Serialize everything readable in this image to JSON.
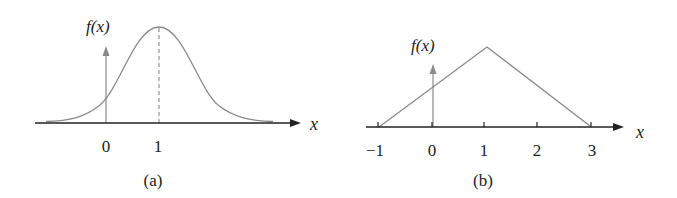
{
  "panels": [
    {
      "id": "a",
      "caption": "(a)",
      "ylabel": "f(x)",
      "xlabel": "x",
      "shape": "bell curve (normal density) centered at x = 1",
      "tick_labels": [
        "0",
        "1"
      ],
      "peak_x": 1,
      "dashed_line_at": 1
    },
    {
      "id": "b",
      "caption": "(b)",
      "ylabel": "f(x)",
      "xlabel": "x",
      "shape": "triangular density from -1 to 3 with peak at x = 1",
      "tick_labels": [
        "−1",
        "0",
        "1",
        "2",
        "3"
      ],
      "support": [
        -1,
        3
      ],
      "peak_x": 1
    }
  ],
  "colors": {
    "axis": "#222222",
    "curve": "#8a8a8a"
  }
}
